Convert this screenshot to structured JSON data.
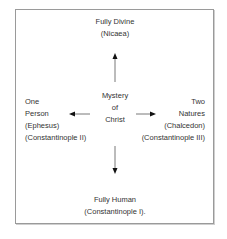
{
  "diagram": {
    "center": {
      "lines": [
        "Mystery",
        "of",
        "Christ"
      ]
    },
    "top": {
      "lines": [
        "Fully Divine",
        "(Nicaea)"
      ]
    },
    "bottom": {
      "lines": [
        "Fully Human",
        "(Constantinople I)."
      ]
    },
    "left": {
      "lines": [
        "One",
        "Person",
        "(Ephesus)",
        "(Constantinople II)"
      ]
    },
    "right": {
      "lines": [
        "Two",
        "Natures",
        "(Chalcedon)",
        "(Constantinople III)"
      ]
    },
    "colors": {
      "border": "#9a9a9a",
      "arrow": "#111111",
      "text": "#333333"
    }
  }
}
